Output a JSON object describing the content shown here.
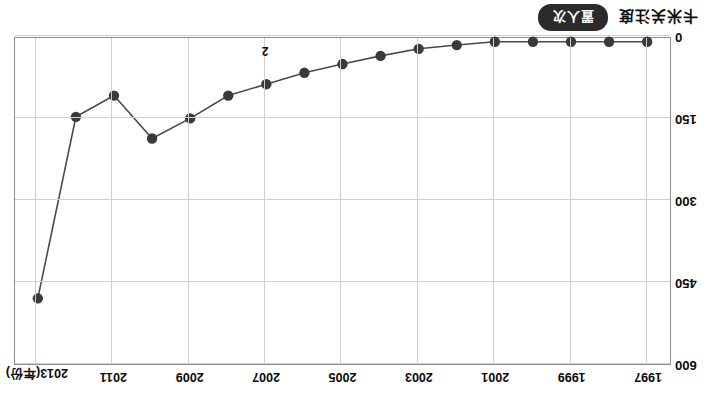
{
  "axes": {
    "x_unit_label": "(年份)",
    "x_ticks": [
      "1997",
      "1999",
      "2001",
      "2003",
      "2005",
      "2007",
      "2009",
      "2011",
      "2013"
    ],
    "y_ticks": [
      "0",
      "150",
      "300",
      "450",
      "600"
    ],
    "y_min": 0,
    "y_max": 600
  },
  "legend": {
    "title": "卡米关注度",
    "series_label": "置人次"
  },
  "annotations": [
    {
      "text": "2",
      "x": 2007,
      "y": 55
    }
  ],
  "chart_data": {
    "type": "line",
    "title": "卡米关注度",
    "xlabel": "(年份)",
    "ylabel": "",
    "ylim": [
      0,
      600
    ],
    "xlim": [
      1996.4,
      2013.6
    ],
    "grid": true,
    "legend_position": "bottom-left",
    "marker": "circle",
    "line_color": "#4a4a4a",
    "marker_color": "#3a3a3a",
    "x": [
      1997,
      1998,
      1999,
      2000,
      2001,
      2002,
      2003,
      2004,
      2005,
      2006,
      2007,
      2008,
      2009,
      2010,
      2011,
      2012,
      2013
    ],
    "categories": [
      "1997",
      "1998",
      "1999",
      "2000",
      "2001",
      "2002",
      "2003",
      "2004",
      "2005",
      "2006",
      "2007",
      "2008",
      "2009",
      "2010",
      "2011",
      "2012",
      "2013"
    ],
    "series": [
      {
        "name": "置人次",
        "values": [
          7,
          7,
          7,
          7,
          7,
          13,
          20,
          33,
          48,
          64,
          85,
          106,
          148,
          185,
          106,
          145,
          479
        ]
      }
    ],
    "values": [
      7,
      7,
      7,
      7,
      7,
      13,
      20,
      33,
      48,
      64,
      85,
      106,
      148,
      185,
      106,
      145,
      479
    ]
  }
}
